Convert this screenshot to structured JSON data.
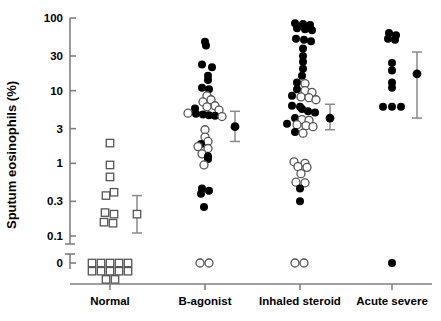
{
  "chart_data": {
    "type": "scatter",
    "title": "",
    "xlabel": "",
    "ylabel": "Sputum eosinophils (%)",
    "yscale": "log-with-zero-break",
    "ytick_labels": [
      "100",
      "30",
      "10",
      "3",
      "1",
      "0.3",
      "0.1",
      "0"
    ],
    "ytick_values": [
      100,
      30,
      10,
      3,
      1,
      0.3,
      0.1,
      0
    ],
    "ylim": [
      0.1,
      100
    ],
    "axis_break": "between 0.1 and 0",
    "grid": false,
    "legend": null,
    "marker_types": {
      "open_square": "Normal subject",
      "filled_circle": "asthma subject (filled)",
      "open_circle": "asthma subject (open)"
    },
    "categories": [
      "Normal",
      "B-agonist",
      "Inhaled steroid",
      "Acute severe"
    ],
    "series": [
      {
        "name": "Normal",
        "marker": "open-square",
        "points": [
          {
            "v": 1.9,
            "dx": 0
          },
          {
            "v": 0.95,
            "dx": 0
          },
          {
            "v": 0.65,
            "dx": 0
          },
          {
            "v": 0.4,
            "dx": 4
          },
          {
            "v": 0.36,
            "dx": -4
          },
          {
            "v": 0.21,
            "dx": -5
          },
          {
            "v": 0.2,
            "dx": 4
          },
          {
            "v": 0.155,
            "dx": -6
          },
          {
            "v": 0.15,
            "dx": 3
          },
          {
            "v": 0,
            "dx": -18
          },
          {
            "v": 0,
            "dx": -9
          },
          {
            "v": 0,
            "dx": 0
          },
          {
            "v": 0,
            "dx": 9
          },
          {
            "v": 0,
            "dx": 18
          },
          {
            "v": 0,
            "dx": -18,
            "row": 1
          },
          {
            "v": 0,
            "dx": -9,
            "row": 1
          },
          {
            "v": 0,
            "dx": 0,
            "row": 1
          },
          {
            "v": 0,
            "dx": 9,
            "row": 1
          },
          {
            "v": 0,
            "dx": 18,
            "row": 1
          },
          {
            "v": 0,
            "dx": -4,
            "row": 2
          },
          {
            "v": 0,
            "dx": 5,
            "row": 2
          }
        ],
        "summary": {
          "marker": "open-square",
          "mean": 0.2,
          "low": 0.11,
          "high": 0.36
        }
      },
      {
        "name": "B-agonist",
        "points": [
          {
            "v": 47,
            "f": 1,
            "dx": 0
          },
          {
            "v": 42,
            "f": 1,
            "dx": 1
          },
          {
            "v": 23,
            "f": 1,
            "dx": -3
          },
          {
            "v": 21,
            "f": 1,
            "dx": 7
          },
          {
            "v": 16,
            "f": 1,
            "dx": 3
          },
          {
            "v": 14,
            "f": 1,
            "dx": 3
          },
          {
            "v": 11,
            "f": 1,
            "dx": -3
          },
          {
            "v": 10.5,
            "f": 1,
            "dx": 4
          },
          {
            "v": 8.5,
            "f": 0,
            "dx": 2
          },
          {
            "v": 7.5,
            "f": 0,
            "dx": 6
          },
          {
            "v": 7,
            "f": 0,
            "dx": -2
          },
          {
            "v": 6.2,
            "f": 0,
            "dx": 10
          },
          {
            "v": 6.0,
            "f": 0,
            "dx": 2
          },
          {
            "v": 5.7,
            "f": 1,
            "dx": -10
          },
          {
            "v": 5.4,
            "f": 0,
            "dx": 14
          },
          {
            "v": 4.9,
            "f": 0,
            "dx": -17
          },
          {
            "v": 4.8,
            "f": 1,
            "dx": -9
          },
          {
            "v": 4.7,
            "f": 1,
            "dx": -2
          },
          {
            "v": 4.6,
            "f": 1,
            "dx": 4
          },
          {
            "v": 4.5,
            "f": 1,
            "dx": 10
          },
          {
            "v": 4.4,
            "f": 0,
            "dx": 17
          },
          {
            "v": 2.9,
            "f": 0,
            "dx": 0
          },
          {
            "v": 2.3,
            "f": 0,
            "dx": 0
          },
          {
            "v": 2.0,
            "f": 0,
            "dx": 3
          },
          {
            "v": 1.85,
            "f": 1,
            "dx": -4
          },
          {
            "v": 1.7,
            "f": 0,
            "dx": -7
          },
          {
            "v": 1.6,
            "f": 0,
            "dx": 3
          },
          {
            "v": 1.35,
            "f": 0,
            "dx": -3
          },
          {
            "v": 1.25,
            "f": 1,
            "dx": 3
          },
          {
            "v": 1.15,
            "f": 1,
            "dx": 3
          },
          {
            "v": 0.95,
            "f": 0,
            "dx": -1
          },
          {
            "v": 0.45,
            "f": 1,
            "dx": -3
          },
          {
            "v": 0.42,
            "f": 1,
            "dx": 4
          },
          {
            "v": 0.38,
            "f": 1,
            "dx": -4
          },
          {
            "v": 0.25,
            "f": 1,
            "dx": -1
          },
          {
            "v": 0,
            "f": 0,
            "dx": -5
          },
          {
            "v": 0,
            "f": 0,
            "dx": 4
          }
        ],
        "summary": {
          "marker": "filled-circle",
          "mean": 3.2,
          "low": 2.0,
          "high": 5.2
        }
      },
      {
        "name": "Inhaled steroid",
        "points": [
          {
            "v": 85,
            "f": 1,
            "dx": -5
          },
          {
            "v": 83,
            "f": 1,
            "dx": 3
          },
          {
            "v": 80,
            "f": 1,
            "dx": 10
          },
          {
            "v": 72,
            "f": 1,
            "dx": -3
          },
          {
            "v": 70,
            "f": 1,
            "dx": 5
          },
          {
            "v": 68,
            "f": 1,
            "dx": 12
          },
          {
            "v": 52,
            "f": 1,
            "dx": -4
          },
          {
            "v": 50,
            "f": 1,
            "dx": 4
          },
          {
            "v": 48,
            "f": 1,
            "dx": 11
          },
          {
            "v": 38,
            "f": 1,
            "dx": 3
          },
          {
            "v": 30,
            "f": 1,
            "dx": 3
          },
          {
            "v": 25,
            "f": 1,
            "dx": 3
          },
          {
            "v": 20,
            "f": 1,
            "dx": 3
          },
          {
            "v": 16,
            "f": 1,
            "dx": 2
          },
          {
            "v": 13,
            "f": 1,
            "dx": -3
          },
          {
            "v": 12.5,
            "f": 0,
            "dx": 5
          },
          {
            "v": 10.5,
            "f": 1,
            "dx": -3
          },
          {
            "v": 10,
            "f": 0,
            "dx": 5
          },
          {
            "v": 9.5,
            "f": 0,
            "dx": 12
          },
          {
            "v": 8.5,
            "f": 1,
            "dx": -8
          },
          {
            "v": 8.2,
            "f": 0,
            "dx": 1
          },
          {
            "v": 8.0,
            "f": 0,
            "dx": 9
          },
          {
            "v": 7.5,
            "f": 0,
            "dx": 16
          },
          {
            "v": 6.2,
            "f": 1,
            "dx": -8
          },
          {
            "v": 6.0,
            "f": 1,
            "dx": 0
          },
          {
            "v": 5.6,
            "f": 1,
            "dx": 2
          },
          {
            "v": 5.2,
            "f": 1,
            "dx": 8
          },
          {
            "v": 5.0,
            "f": 1,
            "dx": 15
          },
          {
            "v": 4.2,
            "f": 1,
            "dx": -5
          },
          {
            "v": 4.0,
            "f": 0,
            "dx": 2
          },
          {
            "v": 3.9,
            "f": 0,
            "dx": 9
          },
          {
            "v": 3.5,
            "f": 1,
            "dx": -13
          },
          {
            "v": 3.4,
            "f": 0,
            "dx": -3
          },
          {
            "v": 3.3,
            "f": 0,
            "dx": 6
          },
          {
            "v": 3.2,
            "f": 0,
            "dx": 13
          },
          {
            "v": 2.7,
            "f": 1,
            "dx": -5
          },
          {
            "v": 2.6,
            "f": 0,
            "dx": 3
          },
          {
            "v": 1.05,
            "f": 0,
            "dx": -6
          },
          {
            "v": 1.0,
            "f": 0,
            "dx": 5
          },
          {
            "v": 0.9,
            "f": 0,
            "dx": -2
          },
          {
            "v": 0.88,
            "f": 0,
            "dx": 7
          },
          {
            "v": 0.72,
            "f": 0,
            "dx": 1
          },
          {
            "v": 0.55,
            "f": 0,
            "dx": -4
          },
          {
            "v": 0.54,
            "f": 0,
            "dx": 5
          },
          {
            "v": 0.45,
            "f": 1,
            "dx": 0
          },
          {
            "v": 0.3,
            "f": 1,
            "dx": 0
          },
          {
            "v": 0,
            "f": 0,
            "dx": -5
          },
          {
            "v": 0,
            "f": 0,
            "dx": 4
          }
        ],
        "summary": {
          "marker": "filled-circle",
          "mean": 4.2,
          "low": 2.9,
          "high": 6.5
        }
      },
      {
        "name": "Acute severe",
        "points": [
          {
            "v": 62,
            "f": 1,
            "dx": -3
          },
          {
            "v": 58,
            "f": 1,
            "dx": 4
          },
          {
            "v": 52,
            "f": 1,
            "dx": -4
          },
          {
            "v": 50,
            "f": 1,
            "dx": 3
          },
          {
            "v": 24,
            "f": 1,
            "dx": 0
          },
          {
            "v": 19,
            "f": 1,
            "dx": 0
          },
          {
            "v": 13,
            "f": 1,
            "dx": 0
          },
          {
            "v": 11,
            "f": 1,
            "dx": 0
          },
          {
            "v": 6.0,
            "f": 1,
            "dx": -9
          },
          {
            "v": 6.0,
            "f": 1,
            "dx": 0
          },
          {
            "v": 6.0,
            "f": 1,
            "dx": 9
          },
          {
            "v": 0,
            "f": 1,
            "dx": 0
          }
        ],
        "summary": {
          "marker": "filled-circle",
          "mean": 17,
          "low": 4.2,
          "high": 34
        }
      }
    ]
  },
  "colors": {
    "axis": "#808080",
    "marker_fill": "#000000",
    "marker_open": "#ffffff",
    "text": "#000000"
  }
}
